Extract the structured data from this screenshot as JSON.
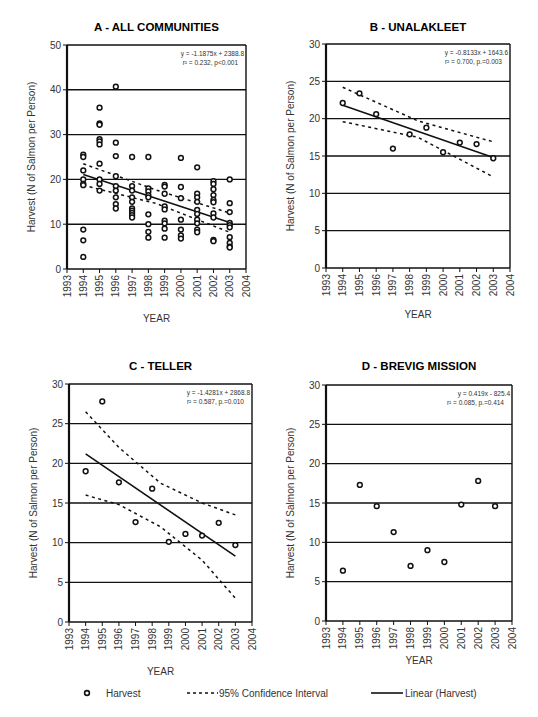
{
  "figure": {
    "legend": {
      "items": [
        {
          "label": "Harvest",
          "kind": "marker"
        },
        {
          "label": "95% Confidence Interval",
          "kind": "dashed"
        },
        {
          "label": "Linear (Harvest)",
          "kind": "solid"
        }
      ]
    }
  },
  "chart_data": [
    {
      "id": "A",
      "type": "scatter",
      "title": "A - ALL COMMUNITIES",
      "xlabel": "YEAR",
      "ylabel": "Harvest (N of Salmon per Person)",
      "xlim": [
        1993,
        2004
      ],
      "ylim": [
        0,
        50
      ],
      "yticks": [
        0,
        10,
        20,
        30,
        40,
        50
      ],
      "xticks": [
        1993,
        1994,
        1995,
        1996,
        1997,
        1998,
        1999,
        2000,
        2001,
        2002,
        2003,
        2004
      ],
      "grid": "horizontal",
      "equation": "y = -1.1875x + 2388.8",
      "stats": "r² = 0.232, p<0.001",
      "fit": {
        "x": [
          1994,
          2003
        ],
        "y": [
          21.1,
          10.4
        ]
      },
      "ci_upper": {
        "x": [
          1994,
          1998.5,
          2003
        ],
        "y": [
          23.5,
          17.6,
          12.5
        ]
      },
      "ci_lower": {
        "x": [
          1994,
          1998.5,
          2003
        ],
        "y": [
          18.7,
          14.6,
          8.2
        ]
      },
      "points": [
        [
          1994,
          25.5
        ],
        [
          1994,
          25
        ],
        [
          1994,
          22
        ],
        [
          1994,
          20
        ],
        [
          1994,
          19
        ],
        [
          1994,
          18.7
        ],
        [
          1994,
          8.8
        ],
        [
          1994,
          6.4
        ],
        [
          1994,
          2.7
        ],
        [
          1995,
          36
        ],
        [
          1995,
          32.5
        ],
        [
          1995,
          32.2
        ],
        [
          1995,
          29
        ],
        [
          1995,
          28.5
        ],
        [
          1995,
          27.8
        ],
        [
          1995,
          23.5
        ],
        [
          1995,
          20
        ],
        [
          1995,
          19
        ],
        [
          1995,
          17.5
        ],
        [
          1996,
          40.7
        ],
        [
          1996,
          28.2
        ],
        [
          1996,
          25.2
        ],
        [
          1996,
          20.7
        ],
        [
          1996,
          18.5
        ],
        [
          1996,
          17.5
        ],
        [
          1996,
          16
        ],
        [
          1996,
          14.5
        ],
        [
          1996,
          13.5
        ],
        [
          1997,
          25
        ],
        [
          1997,
          18.5
        ],
        [
          1997,
          17.5
        ],
        [
          1997,
          16
        ],
        [
          1997,
          15
        ],
        [
          1997,
          13.5
        ],
        [
          1997,
          13
        ],
        [
          1997,
          12.5
        ],
        [
          1997,
          12
        ],
        [
          1997,
          11.5
        ],
        [
          1998,
          25
        ],
        [
          1998,
          18
        ],
        [
          1998,
          17.3
        ],
        [
          1998,
          16.5
        ],
        [
          1998,
          16
        ],
        [
          1998,
          12.2
        ],
        [
          1998,
          10
        ],
        [
          1998,
          8.3
        ],
        [
          1998,
          7
        ],
        [
          1999,
          18.8
        ],
        [
          1999,
          18.4
        ],
        [
          1999,
          16.8
        ],
        [
          1999,
          14
        ],
        [
          1999,
          13.3
        ],
        [
          1999,
          10.8
        ],
        [
          1999,
          10.2
        ],
        [
          1999,
          9
        ],
        [
          1999,
          7
        ],
        [
          2000,
          24.8
        ],
        [
          2000,
          18.3
        ],
        [
          2000,
          15.8
        ],
        [
          2000,
          11
        ],
        [
          2000,
          8.8
        ],
        [
          2000,
          7.5
        ],
        [
          2000,
          6.8
        ],
        [
          2001,
          22.7
        ],
        [
          2001,
          16.8
        ],
        [
          2001,
          16
        ],
        [
          2001,
          15
        ],
        [
          2001,
          13.2
        ],
        [
          2001,
          12.3
        ],
        [
          2001,
          11
        ],
        [
          2001,
          10.2
        ],
        [
          2001,
          8.8
        ],
        [
          2001,
          8.2
        ],
        [
          2002,
          19.6
        ],
        [
          2002,
          19
        ],
        [
          2002,
          17.8
        ],
        [
          2002,
          16.5
        ],
        [
          2002,
          15.4
        ],
        [
          2002,
          14.9
        ],
        [
          2002,
          12.4
        ],
        [
          2002,
          11.5
        ],
        [
          2002,
          6.5
        ],
        [
          2002,
          6.2
        ],
        [
          2003,
          20
        ],
        [
          2003,
          14.7
        ],
        [
          2003,
          12.7
        ],
        [
          2003,
          10.3
        ],
        [
          2003,
          9.8
        ],
        [
          2003,
          9.3
        ],
        [
          2003,
          7.1
        ],
        [
          2003,
          5.8
        ],
        [
          2003,
          5
        ],
        [
          2003,
          4.8
        ]
      ]
    },
    {
      "id": "B",
      "type": "scatter",
      "title": "B - UNALAKLEET",
      "xlabel": "YEAR",
      "ylabel": "Harvest (N of Salmon per Person)",
      "xlim": [
        1993,
        2004
      ],
      "ylim": [
        0,
        30
      ],
      "yticks": [
        0,
        5,
        10,
        15,
        20,
        25,
        30
      ],
      "xticks": [
        1993,
        1994,
        1995,
        1996,
        1997,
        1998,
        1999,
        2000,
        2001,
        2002,
        2003,
        2004
      ],
      "grid": "horizontal",
      "equation": "y = -0.8133x + 1643.6",
      "stats": "r² = 0.700, p.=0.003",
      "fit": {
        "x": [
          1994,
          2003
        ],
        "y": [
          21.8,
          14.8
        ]
      },
      "ci_upper": {
        "x": [
          1994,
          1998.5,
          2003
        ],
        "y": [
          24.2,
          19.7,
          16.9
        ]
      },
      "ci_lower": {
        "x": [
          1994,
          1998.5,
          2003
        ],
        "y": [
          19.6,
          17.5,
          12.2
        ]
      },
      "points": [
        [
          1994,
          22.1
        ],
        [
          1995,
          23.4
        ],
        [
          1996,
          20.6
        ],
        [
          1997,
          16.0
        ],
        [
          1998,
          17.9
        ],
        [
          1999,
          18.8
        ],
        [
          2000,
          15.5
        ],
        [
          2001,
          16.8
        ],
        [
          2002,
          16.6
        ],
        [
          2003,
          14.7
        ]
      ]
    },
    {
      "id": "C",
      "type": "scatter",
      "title": "C - TELLER",
      "xlabel": "YEAR",
      "ylabel": "Harvest (N of Salmon per Person)",
      "xlim": [
        1993,
        2004
      ],
      "ylim": [
        0,
        30
      ],
      "yticks": [
        0,
        5,
        10,
        15,
        20,
        25,
        30
      ],
      "xticks": [
        1993,
        1994,
        1995,
        1996,
        1997,
        1998,
        1999,
        2000,
        2001,
        2002,
        2003,
        2004
      ],
      "grid": "horizontal",
      "equation": "y = -1.4281x + 2868.8",
      "stats": "r² = 0.587, p.=0.010",
      "fit": {
        "x": [
          1994,
          2003
        ],
        "y": [
          21.2,
          8.3
        ]
      },
      "ci_upper": {
        "x": [
          1994,
          1996,
          1998.5,
          2001,
          2003
        ],
        "y": [
          26.5,
          22.0,
          17.5,
          15.0,
          13.5
        ]
      },
      "ci_lower": {
        "x": [
          1994,
          1996,
          1998.5,
          2001,
          2003
        ],
        "y": [
          16.0,
          14.8,
          12.0,
          7.8,
          3.0
        ]
      },
      "points": [
        [
          1994,
          19.0
        ],
        [
          1995,
          27.8
        ],
        [
          1996,
          17.6
        ],
        [
          1997,
          12.6
        ],
        [
          1998,
          16.8
        ],
        [
          1999,
          10.1
        ],
        [
          2000,
          11.1
        ],
        [
          2001,
          10.9
        ],
        [
          2002,
          12.5
        ],
        [
          2003,
          9.7
        ]
      ]
    },
    {
      "id": "D",
      "type": "scatter",
      "title": "D - BREVIG MISSION",
      "xlabel": "YEAR",
      "ylabel": "Harvest (N of Salmon per Person)",
      "xlim": [
        1993,
        2004
      ],
      "ylim": [
        0,
        30
      ],
      "yticks": [
        0,
        5,
        10,
        15,
        20,
        25,
        30
      ],
      "xticks": [
        1993,
        1994,
        1995,
        1996,
        1997,
        1998,
        1999,
        2000,
        2001,
        2002,
        2003,
        2004
      ],
      "grid": "horizontal",
      "equation": "y = 0.419x  - 825.4",
      "stats": "r² = 0.085,  p.=0.414",
      "points": [
        [
          1994,
          6.4
        ],
        [
          1995,
          17.3
        ],
        [
          1996,
          14.6
        ],
        [
          1997,
          11.3
        ],
        [
          1998,
          7.0
        ],
        [
          1999,
          9.0
        ],
        [
          2000,
          7.5
        ],
        [
          2001,
          14.8
        ],
        [
          2002,
          17.8
        ],
        [
          2003,
          14.6
        ]
      ]
    }
  ]
}
